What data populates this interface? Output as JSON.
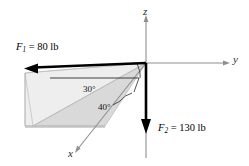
{
  "figure": {
    "kind": "3d-force-diagram",
    "background_color": "#ffffff",
    "axes": {
      "x_label": "x",
      "y_label": "y",
      "z_label": "z",
      "axis_color": "#8c8c8c"
    },
    "forces": [
      {
        "id": "F1",
        "symbol": "F",
        "subscript": "1",
        "equals": "=",
        "magnitude": "80",
        "unit": "lb",
        "label": "F1 = 80 lb",
        "direction": "up-left",
        "color": "#000000"
      },
      {
        "id": "F2",
        "symbol": "F",
        "subscript": "2",
        "equals": "=",
        "magnitude": "130",
        "unit": "lb",
        "label": "F2 = 130 lb",
        "direction": "down",
        "color": "#000000"
      }
    ],
    "angles": [
      {
        "id": "angle-30",
        "value": "30",
        "unit": "°",
        "label": "30°"
      },
      {
        "id": "angle-40",
        "value": "40",
        "unit": "°",
        "label": "40°"
      }
    ],
    "shading": {
      "upper_plane_color": "#eeeeee",
      "lower_plane_color": "#d8d8d8",
      "edge_color": "#b0b0b0"
    }
  }
}
